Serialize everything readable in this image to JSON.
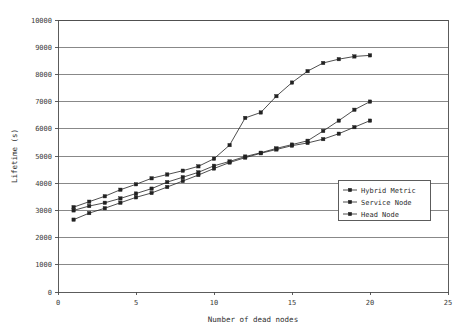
{
  "chart_data": {
    "type": "line",
    "title": "",
    "xlabel": "Number of dead nodes",
    "ylabel": "Lifetime (s)",
    "xlim": [
      0,
      25
    ],
    "ylim": [
      0,
      10000
    ],
    "xticks": [
      "0",
      "5",
      "10",
      "15",
      "20",
      "25"
    ],
    "xtick_values": [
      0,
      5,
      10,
      15,
      20,
      25
    ],
    "yticks": [
      "0",
      "1000",
      "2000",
      "3000",
      "4000",
      "5000",
      "6000",
      "7000",
      "8000",
      "9000",
      "10000"
    ],
    "ytick_values": [
      0,
      1000,
      2000,
      3000,
      4000,
      5000,
      6000,
      7000,
      8000,
      9000,
      10000
    ],
    "grid": "horizontal",
    "legend_position": "center-right",
    "x": [
      1,
      2,
      3,
      4,
      5,
      6,
      7,
      8,
      9,
      10,
      11,
      12,
      13,
      14,
      15,
      16,
      17,
      18,
      19,
      20
    ],
    "series": [
      {
        "name": "Hybrid Metric",
        "marker": "square",
        "color": "#222222",
        "values": [
          3120,
          3320,
          3520,
          3760,
          3960,
          4180,
          4320,
          4460,
          4620,
          4900,
          5400,
          6400,
          6600,
          7200,
          7700,
          8120,
          8420,
          8560,
          8660,
          8700
        ]
      },
      {
        "name": "Service Node",
        "marker": "square",
        "color": "#222222",
        "values": [
          3000,
          3160,
          3280,
          3440,
          3620,
          3800,
          4040,
          4220,
          4400,
          4640,
          4800,
          4980,
          5120,
          5280,
          5420,
          5560,
          5920,
          6300,
          6700,
          7000
        ]
      },
      {
        "name": "Head Node",
        "marker": "square",
        "color": "#222222",
        "values": [
          2660,
          2900,
          3080,
          3280,
          3480,
          3640,
          3860,
          4080,
          4300,
          4540,
          4760,
          4940,
          5100,
          5240,
          5380,
          5480,
          5620,
          5820,
          6060,
          6300
        ]
      }
    ]
  },
  "legend": {
    "entries": [
      {
        "label": "Hybrid Metric"
      },
      {
        "label": "Service Node"
      },
      {
        "label": "Head Node"
      }
    ]
  }
}
